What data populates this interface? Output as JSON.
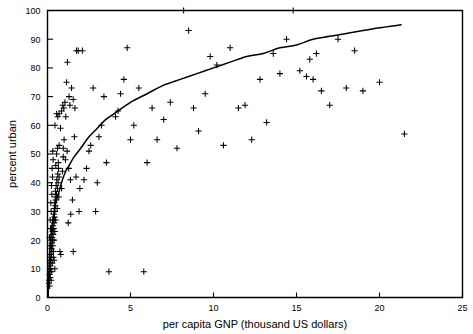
{
  "chart_data": {
    "type": "scatter",
    "title": "",
    "xlabel": "per capita GNP (thousand US dollars)",
    "ylabel": "percent urban",
    "xlim": [
      0,
      25
    ],
    "ylim": [
      0,
      100
    ],
    "xticks": [
      0,
      5,
      10,
      15,
      20,
      25
    ],
    "yticks": [
      0,
      10,
      20,
      30,
      40,
      50,
      60,
      70,
      80,
      90,
      100
    ],
    "grid": false,
    "legend": null,
    "marker_style": "plus",
    "marker_color": "#000000",
    "series": [
      {
        "name": "countries",
        "type": "scatter",
        "points": [
          [
            0.08,
            5
          ],
          [
            0.1,
            6
          ],
          [
            0.12,
            8
          ],
          [
            0.13,
            4
          ],
          [
            0.15,
            9
          ],
          [
            0.16,
            11
          ],
          [
            0.17,
            7
          ],
          [
            0.18,
            13
          ],
          [
            0.19,
            10
          ],
          [
            0.2,
            12
          ],
          [
            0.21,
            15
          ],
          [
            0.22,
            6
          ],
          [
            0.23,
            14
          ],
          [
            0.24,
            17
          ],
          [
            0.25,
            9
          ],
          [
            0.26,
            19
          ],
          [
            0.27,
            16
          ],
          [
            0.28,
            21
          ],
          [
            0.29,
            12
          ],
          [
            0.3,
            20
          ],
          [
            0.31,
            23
          ],
          [
            0.32,
            18
          ],
          [
            0.33,
            25
          ],
          [
            0.34,
            22
          ],
          [
            0.35,
            14
          ],
          [
            0.36,
            27
          ],
          [
            0.37,
            24
          ],
          [
            0.38,
            29
          ],
          [
            0.39,
            20
          ],
          [
            0.4,
            26
          ],
          [
            0.41,
            31
          ],
          [
            0.42,
            28
          ],
          [
            0.43,
            33
          ],
          [
            0.44,
            23
          ],
          [
            0.45,
            30
          ],
          [
            0.46,
            35
          ],
          [
            0.47,
            32
          ],
          [
            0.48,
            37
          ],
          [
            0.49,
            27
          ],
          [
            0.5,
            34
          ],
          [
            0.52,
            39
          ],
          [
            0.54,
            36
          ],
          [
            0.56,
            41
          ],
          [
            0.58,
            31
          ],
          [
            0.6,
            38
          ],
          [
            0.62,
            43
          ],
          [
            0.64,
            40
          ],
          [
            0.66,
            45
          ],
          [
            0.68,
            35
          ],
          [
            0.7,
            42
          ],
          [
            0.15,
            18
          ],
          [
            0.18,
            24
          ],
          [
            0.22,
            30
          ],
          [
            0.26,
            36
          ],
          [
            0.3,
            42
          ],
          [
            0.34,
            48
          ],
          [
            0.12,
            21
          ],
          [
            0.16,
            27
          ],
          [
            0.2,
            33
          ],
          [
            0.24,
            39
          ],
          [
            0.28,
            45
          ],
          [
            0.32,
            51
          ],
          [
            0.36,
            16
          ],
          [
            0.4,
            13
          ],
          [
            0.44,
            10
          ],
          [
            0.5,
            46
          ],
          [
            0.55,
            50
          ],
          [
            0.6,
            52
          ],
          [
            0.65,
            47
          ],
          [
            0.7,
            53
          ],
          [
            0.75,
            16
          ],
          [
            0.8,
            15
          ],
          [
            0.85,
            38
          ],
          [
            0.9,
            44
          ],
          [
            0.95,
            49
          ],
          [
            0.45,
            60
          ],
          [
            0.55,
            64
          ],
          [
            0.62,
            63
          ],
          [
            0.7,
            64
          ],
          [
            0.78,
            59
          ],
          [
            0.85,
            65
          ],
          [
            0.92,
            67
          ],
          [
            0.98,
            66
          ],
          [
            1.05,
            68
          ],
          [
            1.1,
            63
          ],
          [
            1.15,
            75
          ],
          [
            1.2,
            82
          ],
          [
            1.3,
            70
          ],
          [
            1.35,
            67
          ],
          [
            1.45,
            73
          ],
          [
            1.55,
            69
          ],
          [
            1.65,
            66
          ],
          [
            1.75,
            86
          ],
          [
            1.85,
            86
          ],
          [
            2.1,
            86
          ],
          [
            0.95,
            52
          ],
          [
            1.0,
            55
          ],
          [
            1.08,
            48
          ],
          [
            1.18,
            51
          ],
          [
            1.28,
            45
          ],
          [
            1.38,
            41
          ],
          [
            1.5,
            34
          ],
          [
            1.62,
            56
          ],
          [
            1.72,
            42
          ],
          [
            1.95,
            38
          ],
          [
            1.25,
            26
          ],
          [
            1.4,
            29
          ],
          [
            1.55,
            16
          ],
          [
            1.9,
            30
          ],
          [
            2.2,
            41
          ],
          [
            2.35,
            45
          ],
          [
            2.5,
            51
          ],
          [
            2.6,
            53
          ],
          [
            2.75,
            73
          ],
          [
            2.9,
            30
          ],
          [
            3.0,
            40
          ],
          [
            3.1,
            56
          ],
          [
            3.25,
            60
          ],
          [
            3.4,
            70
          ],
          [
            3.55,
            47
          ],
          [
            3.7,
            9
          ],
          [
            4.1,
            63
          ],
          [
            4.25,
            65
          ],
          [
            4.4,
            71
          ],
          [
            4.6,
            76
          ],
          [
            4.8,
            87
          ],
          [
            5.0,
            55
          ],
          [
            5.2,
            60
          ],
          [
            5.5,
            73
          ],
          [
            5.8,
            9
          ],
          [
            6.0,
            47
          ],
          [
            6.3,
            66
          ],
          [
            6.6,
            55
          ],
          [
            7.0,
            62
          ],
          [
            7.4,
            68
          ],
          [
            7.8,
            52
          ],
          [
            8.2,
            100
          ],
          [
            8.5,
            93
          ],
          [
            8.8,
            66
          ],
          [
            9.1,
            58
          ],
          [
            9.5,
            71
          ],
          [
            9.8,
            84
          ],
          [
            10.2,
            81
          ],
          [
            10.6,
            53
          ],
          [
            11.0,
            87
          ],
          [
            11.5,
            66
          ],
          [
            11.9,
            67
          ],
          [
            12.3,
            55
          ],
          [
            12.8,
            76
          ],
          [
            13.2,
            61
          ],
          [
            13.6,
            85
          ],
          [
            14.0,
            78
          ],
          [
            14.4,
            90
          ],
          [
            14.8,
            100
          ],
          [
            15.2,
            79
          ],
          [
            15.6,
            77
          ],
          [
            15.8,
            83
          ],
          [
            16.0,
            76
          ],
          [
            16.2,
            85
          ],
          [
            16.5,
            72
          ],
          [
            17.0,
            67
          ],
          [
            17.5,
            90
          ],
          [
            18.0,
            73
          ],
          [
            18.5,
            86
          ],
          [
            19.0,
            72
          ],
          [
            20.0,
            75
          ],
          [
            21.5,
            57
          ]
        ]
      },
      {
        "name": "fitted curve",
        "type": "line",
        "description": "logarithmic fit of percent urban on per capita GNP",
        "x_range": [
          0.04,
          21.3
        ],
        "points": [
          [
            0.04,
            0
          ],
          [
            0.08,
            8
          ],
          [
            0.12,
            14
          ],
          [
            0.16,
            18
          ],
          [
            0.2,
            21
          ],
          [
            0.25,
            24
          ],
          [
            0.3,
            26
          ],
          [
            0.4,
            30
          ],
          [
            0.5,
            33
          ],
          [
            0.6,
            35
          ],
          [
            0.75,
            38
          ],
          [
            0.9,
            41
          ],
          [
            1.1,
            44
          ],
          [
            1.3,
            46
          ],
          [
            1.6,
            49
          ],
          [
            2.0,
            52
          ],
          [
            2.5,
            56
          ],
          [
            3.0,
            59
          ],
          [
            3.5,
            62
          ],
          [
            4.0,
            64
          ],
          [
            5.0,
            68
          ],
          [
            6.0,
            71
          ],
          [
            7.0,
            74
          ],
          [
            8.0,
            76
          ],
          [
            9.0,
            78
          ],
          [
            10.0,
            80
          ],
          [
            11.0,
            82
          ],
          [
            12.0,
            84
          ],
          [
            13.0,
            85
          ],
          [
            14.0,
            87
          ],
          [
            15.0,
            88
          ],
          [
            16.0,
            90
          ],
          [
            17.0,
            91
          ],
          [
            18.0,
            92
          ],
          [
            19.0,
            93
          ],
          [
            20.0,
            94
          ],
          [
            21.3,
            95
          ]
        ]
      }
    ]
  }
}
